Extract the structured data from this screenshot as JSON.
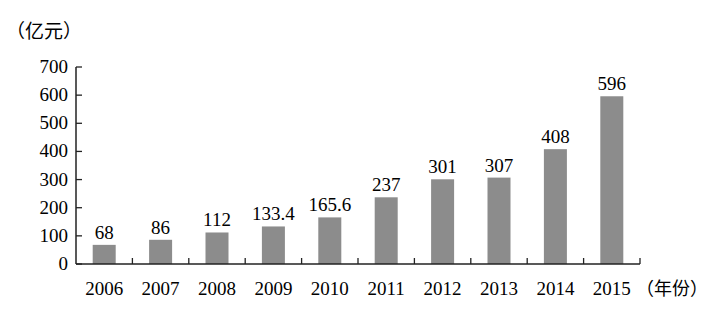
{
  "chart_data": {
    "type": "bar",
    "title": "",
    "ylabel": "（亿元）",
    "xlabel": "（年份）",
    "categories": [
      "2006",
      "2007",
      "2008",
      "2009",
      "2010",
      "2011",
      "2012",
      "2013",
      "2014",
      "2015"
    ],
    "values": [
      68,
      86,
      112,
      133.4,
      165.6,
      237,
      301,
      307,
      408,
      596
    ],
    "value_labels": [
      "68",
      "86",
      "112",
      "133.4",
      "165.6",
      "237",
      "301",
      "307",
      "408",
      "596"
    ],
    "ylim": [
      0,
      700
    ],
    "yticks": [
      0,
      100,
      200,
      300,
      400,
      500,
      600,
      700
    ],
    "grid": false,
    "legend": null,
    "bar_color": "#8c8c8c"
  }
}
